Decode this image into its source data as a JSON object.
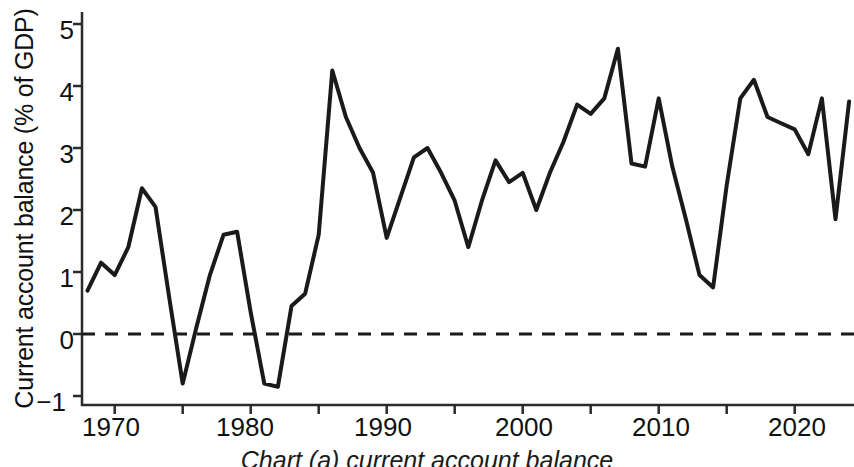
{
  "chart_data": {
    "type": "line",
    "title": "",
    "xlabel": "",
    "ylabel": "Current account balance (% of GDP)",
    "xlim": [
      1968,
      1924.5
    ],
    "ylim": [
      -1,
      5
    ],
    "grid": false,
    "legend": "none",
    "zero_reference_line": {
      "value": 0,
      "style": "dashed"
    },
    "y_ticks": [
      -1,
      0,
      1,
      2,
      3,
      4,
      5
    ],
    "y_tick_labels": [
      "−1",
      "0",
      "1",
      "2",
      "3",
      "4",
      "5"
    ],
    "x_ticks": [
      1970,
      1975,
      1980,
      1985,
      1990,
      1995,
      2000,
      2005,
      2010,
      2015,
      2020
    ],
    "x_tick_labels": [
      "1970",
      "",
      "1980",
      "",
      "1990",
      "",
      "2000",
      "",
      "2010",
      "",
      "2020"
    ],
    "x": [
      1968,
      1969,
      1970,
      1971,
      1972,
      1973,
      1974,
      1975,
      1976,
      1977,
      1978,
      1979,
      1980,
      1981,
      1982,
      1983,
      1984,
      1985,
      1986,
      1987,
      1988,
      1989,
      1990,
      1991,
      1992,
      1993,
      1994,
      1995,
      1996,
      1997,
      1998,
      1999,
      2000,
      2001,
      2002,
      2003,
      2004,
      2005,
      2006,
      2007,
      2008,
      2009,
      2010,
      2011,
      2012,
      2013,
      2014,
      2015,
      2016,
      2017,
      2018,
      2019,
      2020,
      2021,
      2022,
      2023,
      2024
    ],
    "values": [
      0.7,
      1.15,
      0.95,
      1.4,
      2.35,
      2.05,
      0.6,
      -0.8,
      0.1,
      0.95,
      1.6,
      1.65,
      0.35,
      -0.8,
      -0.85,
      0.45,
      0.65,
      1.6,
      4.25,
      3.5,
      3.0,
      2.6,
      1.55,
      2.2,
      2.85,
      3.0,
      2.6,
      2.15,
      1.4,
      2.15,
      2.8,
      2.45,
      2.6,
      2.0,
      2.6,
      3.1,
      3.7,
      3.55,
      3.8,
      4.6,
      2.75,
      2.7,
      3.8,
      2.7,
      1.85,
      0.95,
      0.75,
      2.4,
      3.8,
      4.1,
      3.5,
      3.4,
      3.3,
      2.9,
      3.8,
      1.85,
      3.75
    ],
    "series_name": "Current account balance",
    "line_color": "#1a1a1a",
    "line_width": 4
  },
  "axis": {
    "y_label": "Current account balance (% of GDP)",
    "y_tick_labels": [
      "5",
      "4",
      "3",
      "2",
      "1",
      "0",
      "−1"
    ],
    "x_tick_labels": [
      "1970",
      "1980",
      "1990",
      "2000",
      "2010",
      "2020"
    ]
  },
  "caption": {
    "text": "Chart (a)    current account balance"
  }
}
